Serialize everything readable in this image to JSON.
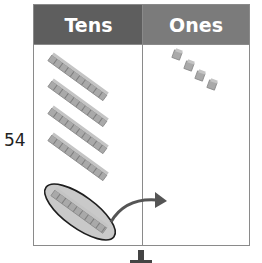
{
  "number_label": "54",
  "columns": [
    {
      "label": "Tens",
      "header_color": "#5e5e5e"
    },
    {
      "label": "Ones",
      "header_color": "#7b7b7b"
    }
  ],
  "tens": {
    "rods": 5,
    "circled_rod_index": 4
  },
  "ones": {
    "cubes": 4
  },
  "annotations": {
    "regroup_arrow": "curved-arrow-from-tens-to-ones",
    "down_arrow": "down-arrow-below-chart"
  },
  "colors": {
    "block": "#a9a9a9",
    "block_dark": "#7d7d7d",
    "ellipse_fill": "#c9c9c9",
    "arrow": "#555555",
    "border": "#8a8a8a"
  }
}
